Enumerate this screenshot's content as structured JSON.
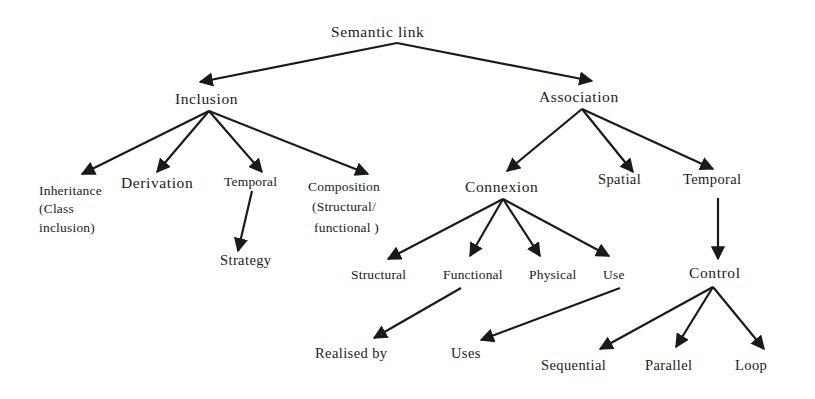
{
  "diagram": {
    "title": "Semantic link",
    "colors": {
      "ink": "#1a1a1a",
      "background": "#ffffff"
    },
    "nodes": {
      "root": {
        "label": "Semantic link"
      },
      "inclusion": {
        "label": "Inclusion"
      },
      "association": {
        "label": "Association"
      },
      "inheritance": {
        "lines": [
          "Inheritance",
          "(Class",
          "inclusion)"
        ]
      },
      "derivation": {
        "label": "Derivation"
      },
      "temporal_inclusion": {
        "label": "Temporal"
      },
      "composition": {
        "lines": [
          "Composition",
          "(Structural/",
          "functional )"
        ]
      },
      "strategy": {
        "label": "Strategy"
      },
      "connexion": {
        "label": "Connexion"
      },
      "spatial": {
        "label": "Spatial"
      },
      "temporal_association": {
        "label": "Temporal"
      },
      "structural": {
        "label": "Structural"
      },
      "functional": {
        "label": "Functional"
      },
      "physical": {
        "label": "Physical"
      },
      "use": {
        "label": "Use"
      },
      "control": {
        "label": "Control"
      },
      "realised_by": {
        "label": "Realised by"
      },
      "uses": {
        "label": "Uses"
      },
      "sequential": {
        "label": "Sequential"
      },
      "parallel": {
        "label": "Parallel"
      },
      "loop": {
        "label": "Loop"
      }
    },
    "edges": [
      {
        "from": "Semantic link",
        "to": "Inclusion"
      },
      {
        "from": "Semantic link",
        "to": "Association"
      },
      {
        "from": "Inclusion",
        "to": "Inheritance (Class inclusion)"
      },
      {
        "from": "Inclusion",
        "to": "Derivation"
      },
      {
        "from": "Inclusion",
        "to": "Temporal"
      },
      {
        "from": "Inclusion",
        "to": "Composition (Structural/functional)"
      },
      {
        "from": "Temporal",
        "to": "Strategy"
      },
      {
        "from": "Association",
        "to": "Connexion"
      },
      {
        "from": "Association",
        "to": "Spatial"
      },
      {
        "from": "Association",
        "to": "Temporal"
      },
      {
        "from": "Connexion",
        "to": "Structural"
      },
      {
        "from": "Connexion",
        "to": "Functional"
      },
      {
        "from": "Connexion",
        "to": "Physical"
      },
      {
        "from": "Connexion",
        "to": "Use"
      },
      {
        "from": "Functional",
        "to": "Realised by"
      },
      {
        "from": "Use",
        "to": "Uses"
      },
      {
        "from": "Temporal",
        "to": "Control"
      },
      {
        "from": "Control",
        "to": "Sequential"
      },
      {
        "from": "Control",
        "to": "Parallel"
      },
      {
        "from": "Control",
        "to": "Loop"
      }
    ]
  }
}
